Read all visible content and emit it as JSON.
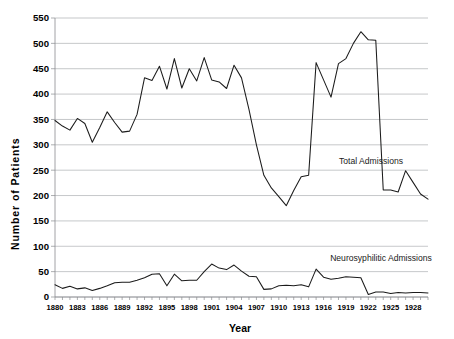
{
  "chart_data": {
    "type": "line",
    "title": "",
    "xlabel": "Year",
    "ylabel": "Number  of  Patients",
    "ylim": [
      0,
      550
    ],
    "ytick_step": 50,
    "yticks": [
      0,
      50,
      100,
      150,
      200,
      250,
      300,
      350,
      400,
      450,
      500,
      550
    ],
    "xlim": [
      1880,
      1930
    ],
    "xticks": [
      1880,
      1883,
      1886,
      1889,
      1892,
      1895,
      1898,
      1901,
      1904,
      1907,
      1910,
      1913,
      1916,
      1919,
      1922,
      1925,
      1928
    ],
    "grid": true,
    "grid_axis": "y",
    "legend_position": "inline-annotation",
    "line_color": "#1b1b1b",
    "grid_color": "#aeb0b3",
    "x": [
      1880,
      1881,
      1882,
      1883,
      1884,
      1885,
      1886,
      1887,
      1888,
      1889,
      1890,
      1891,
      1892,
      1893,
      1894,
      1895,
      1896,
      1897,
      1898,
      1899,
      1900,
      1901,
      1902,
      1903,
      1904,
      1905,
      1906,
      1907,
      1908,
      1909,
      1910,
      1911,
      1912,
      1913,
      1914,
      1915,
      1916,
      1917,
      1918,
      1919,
      1920,
      1921,
      1922,
      1923,
      1924,
      1925,
      1926,
      1927,
      1928,
      1929,
      1930
    ],
    "series": [
      {
        "name": "Total Admissions",
        "annotation": "Total Admissions",
        "values": [
          348,
          337,
          329,
          352,
          342,
          305,
          334,
          365,
          344,
          325,
          327,
          360,
          432,
          427,
          455,
          410,
          470,
          412,
          450,
          426,
          472,
          428,
          424,
          411,
          457,
          432,
          370,
          300,
          240,
          215,
          198,
          180,
          210,
          237,
          240,
          462,
          428,
          394,
          460,
          470,
          500,
          523,
          507,
          506,
          211,
          211,
          207,
          249,
          226,
          203,
          193
        ]
      },
      {
        "name": "Neurosyphilitic Admissions",
        "annotation": "Neurosyphilitic Admissions",
        "values": [
          24,
          17,
          21,
          16,
          18,
          13,
          17,
          22,
          28,
          29,
          29,
          33,
          38,
          45,
          46,
          22,
          45,
          32,
          33,
          33,
          50,
          65,
          57,
          54,
          63,
          51,
          41,
          40,
          15,
          16,
          22,
          23,
          22,
          24,
          20,
          55,
          39,
          35,
          37,
          40,
          39,
          38,
          5,
          10,
          10,
          7,
          9,
          8,
          9,
          9,
          8
        ]
      }
    ]
  },
  "annotations": {
    "total_admissions": "Total Admissions",
    "neurosyphilitic_admissions": "Neurosyphilitic Admissions"
  },
  "axes": {
    "y_title": "Number  of  Patients",
    "x_title": "Year"
  }
}
